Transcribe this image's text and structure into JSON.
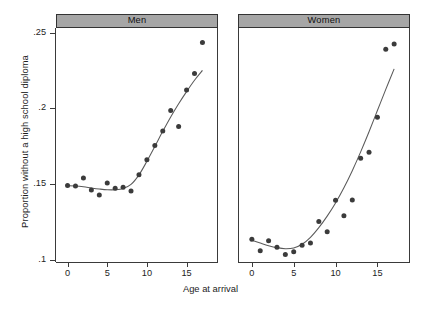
{
  "chart_data": {
    "type": "scatter",
    "title": "",
    "xlabel": "Age at arrival",
    "ylabel": "Proportion without a high school diploma",
    "xlim": [
      -0.7,
      17.7
    ],
    "ylim": [
      0.0985,
      0.253
    ],
    "xticks": [
      0,
      5,
      10,
      15
    ],
    "xticklabels": [
      "0",
      "5",
      "10",
      "15"
    ],
    "yticks": [
      0.1,
      0.15,
      0.2,
      0.25
    ],
    "yticklabels": [
      ".1",
      ".15",
      ".2",
      ".25"
    ],
    "grid": false,
    "legend": null,
    "panel_layout": "side-by-side facets",
    "marker": "filled-circle",
    "marker_color": "#3b3b3b",
    "line_color": "#5a5a5a",
    "strip_color": "#a6a6a6",
    "panels": [
      {
        "label": "Men",
        "x": [
          0,
          1,
          2,
          3,
          4,
          5,
          6,
          7,
          8,
          9,
          10,
          11,
          12,
          13,
          14,
          15,
          16,
          17
        ],
        "values": [
          0.149,
          0.1487,
          0.154,
          0.146,
          0.1428,
          0.1507,
          0.1472,
          0.1478,
          0.1453,
          0.1561,
          0.166,
          0.1755,
          0.185,
          0.1985,
          0.188,
          0.212,
          0.223,
          0.2435
        ],
        "fit": {
          "x": [
            0,
            1,
            2,
            3,
            4,
            5,
            6,
            7,
            8,
            9,
            10,
            11,
            12,
            13,
            14,
            15,
            16,
            17
          ],
          "y": [
            0.1488,
            0.1487,
            0.1482,
            0.1474,
            0.1467,
            0.1462,
            0.1462,
            0.147,
            0.1497,
            0.156,
            0.165,
            0.1748,
            0.1848,
            0.1943,
            0.203,
            0.211,
            0.2185,
            0.225
          ]
        }
      },
      {
        "label": "Women",
        "x": [
          0,
          1,
          2,
          3,
          4,
          5,
          6,
          7,
          8,
          9,
          10,
          11,
          12,
          13,
          14,
          15,
          16,
          17
        ],
        "values": [
          0.1135,
          0.106,
          0.1125,
          0.1082,
          0.1035,
          0.1052,
          0.1095,
          0.111,
          0.1252,
          0.1185,
          0.1393,
          0.129,
          0.1395,
          0.167,
          0.171,
          0.194,
          0.239,
          0.2425
        ],
        "fit": {
          "x": [
            0,
            1,
            2,
            3,
            4,
            5,
            6,
            7,
            8,
            9,
            10,
            11,
            12,
            13,
            14,
            15,
            16,
            17
          ],
          "y": [
            0.1128,
            0.111,
            0.1093,
            0.108,
            0.1073,
            0.1078,
            0.1102,
            0.1148,
            0.1212,
            0.1288,
            0.1375,
            0.1475,
            0.1588,
            0.1712,
            0.1845,
            0.1985,
            0.2125,
            0.226
          ]
        }
      }
    ]
  },
  "axis": {
    "y_title": "Proportion without a high school diploma",
    "x_title": "Age at arrival"
  }
}
